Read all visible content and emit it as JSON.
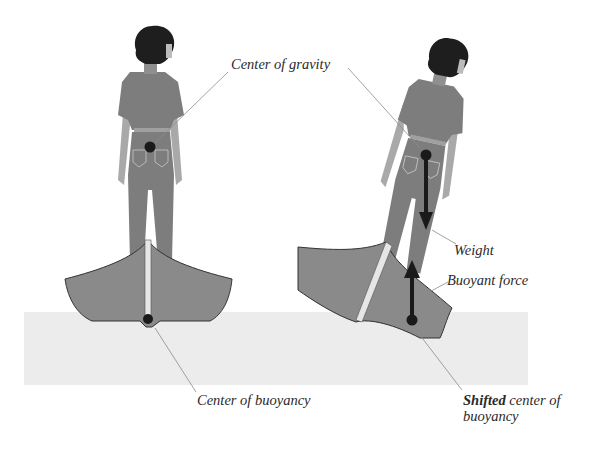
{
  "labels": {
    "center_of_gravity": "Center of gravity",
    "center_of_buoyancy": "Center of buoyancy",
    "weight": "Weight",
    "buoyant_force": "Buoyant force",
    "shifted_bold": "Shifted",
    "shifted_rest_line1": " center of",
    "shifted_line2": "buoyancy"
  },
  "colors": {
    "body": "#7d7d7d",
    "hair": "#1e1e1e",
    "skin": "#a9a9a9",
    "boat": "#8a8a8a",
    "water": "#ececec",
    "dot": "#1a1a1a",
    "leader": "#8c8c8c"
  }
}
